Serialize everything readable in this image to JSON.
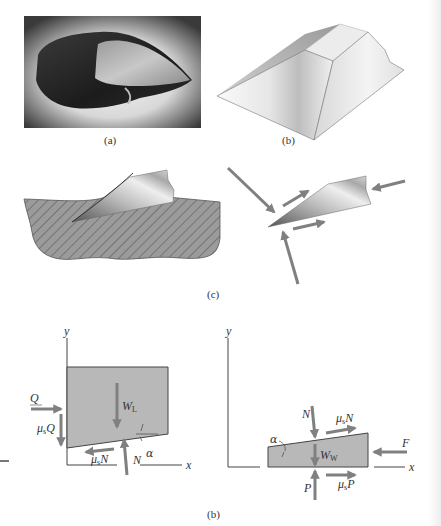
{
  "figure": {
    "panel_a": {
      "caption": "(a)",
      "subject": "stone hand axe photograph"
    },
    "panel_b_top": {
      "caption": "(b)",
      "subject": "wedge-shaped flake 3D rendering"
    },
    "panel_c": {
      "caption": "(c)",
      "subject": "flake splitting from hatched stone core, with force arrows"
    },
    "panel_b_bottom": {
      "caption": "(b)",
      "left_diagram": {
        "axis_x": "x",
        "axis_y": "y",
        "forces": {
          "Q": "Q",
          "mu_s_Q_mu": "μ",
          "mu_s_Q_sub": "s",
          "mu_s_Q_var": "Q",
          "W_L_var": "W",
          "W_L_sub": "L",
          "mu_s_N_mu": "μ",
          "mu_s_N_sub": "s",
          "mu_s_N_var": "N",
          "N": "N",
          "alpha": "α"
        }
      },
      "right_diagram": {
        "axis_x": "x",
        "axis_y": "y",
        "forces": {
          "N": "N",
          "mu_s_N_mu": "μ",
          "mu_s_N_sub": "s",
          "mu_s_N_var": "N",
          "alpha": "α",
          "W_W_var": "W",
          "W_W_sub": "W",
          "F": "F",
          "P": "P",
          "mu_s_P_mu": "μ",
          "mu_s_P_sub": "s",
          "mu_s_P_var": "P"
        }
      }
    }
  }
}
